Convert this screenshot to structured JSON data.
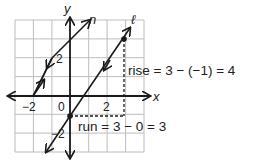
{
  "axes": {
    "x_label": "x",
    "y_label": "y",
    "origin_label": "0"
  },
  "ticks": {
    "x_neg2": "−2",
    "x_2": "2",
    "y_2": "2",
    "y_neg2": "−2"
  },
  "lines": {
    "n_label": "n",
    "l_label": "ℓ"
  },
  "annotations": {
    "rise": "rise = 3 − (−1) = 4",
    "run": "run = 3 − 0 = 3"
  },
  "points": [
    {
      "x": 0,
      "y": -1
    },
    {
      "x": 3,
      "y": 3
    }
  ],
  "colors": {
    "grid": "#bdbdbd",
    "ink": "#1a1a1a"
  }
}
